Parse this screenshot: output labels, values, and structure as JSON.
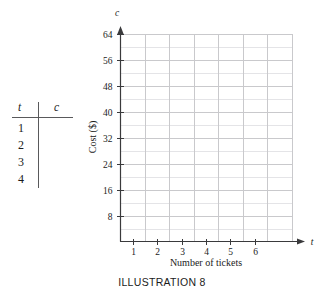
{
  "table": {
    "name": "ticket-cost-table",
    "headers": [
      "t",
      "c"
    ],
    "rows": [
      {
        "t": "1",
        "c": ""
      },
      {
        "t": "2",
        "c": ""
      },
      {
        "t": "3",
        "c": ""
      },
      {
        "t": "4",
        "c": ""
      }
    ]
  },
  "caption": {
    "text": "ILLUSTRATION 8"
  },
  "chart_data": {
    "type": "scatter",
    "title": "",
    "xlabel": "Number of tickets",
    "ylabel": "Cost ($)",
    "x_axis_variable": "t",
    "y_axis_variable": "c",
    "x_ticks": [
      "1",
      "2",
      "3",
      "4",
      "5",
      "6"
    ],
    "x_tick_values": [
      1,
      2,
      3,
      4,
      5,
      6
    ],
    "y_ticks": [
      "8",
      "16",
      "24",
      "32",
      "40",
      "48",
      "56",
      "64"
    ],
    "y_tick_values": [
      8,
      16,
      24,
      32,
      40,
      48,
      56,
      64
    ],
    "xlim": [
      0,
      7
    ],
    "ylim": [
      0,
      64
    ],
    "grid": true,
    "grid_minor_y": true,
    "legend": "none",
    "series": [
      {
        "name": "cost",
        "x": [],
        "y": []
      }
    ],
    "colors": {
      "axis": "#3a3a3c",
      "grid_major": "#c9c9cc",
      "grid_minor": "#e4e4e7",
      "text": "#1b1b1b",
      "background": "#ffffff"
    }
  }
}
